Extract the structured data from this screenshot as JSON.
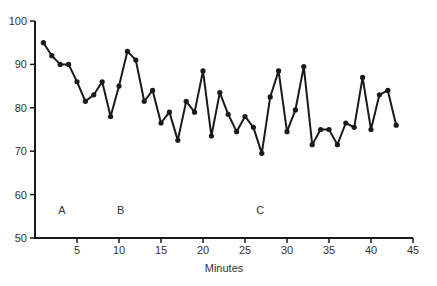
{
  "chart_data": {
    "type": "line",
    "title": "",
    "xlabel": "Minutes",
    "ylabel": "",
    "xlim": [
      0,
      45
    ],
    "ylim": [
      50,
      100
    ],
    "x_ticks": [
      5,
      10,
      15,
      20,
      25,
      30,
      35,
      40,
      45
    ],
    "y_ticks": [
      50,
      60,
      70,
      80,
      90,
      100
    ],
    "grid": false,
    "legend": null,
    "series": [
      {
        "name": "series",
        "x": [
          1,
          2,
          3,
          4,
          5,
          6,
          7,
          8,
          9,
          10,
          11,
          12,
          13,
          14,
          15,
          16,
          17,
          18,
          19,
          20,
          21,
          22,
          23,
          24,
          25,
          26,
          27,
          28,
          29,
          30,
          31,
          32,
          33,
          34,
          35,
          36,
          37,
          38,
          39,
          40,
          41,
          42,
          43
        ],
        "values": [
          95,
          92,
          90,
          90,
          86,
          81.5,
          83,
          86,
          78,
          85,
          93,
          91,
          81.5,
          84,
          76.5,
          79,
          72.5,
          81.5,
          79,
          88.5,
          73.5,
          83.5,
          78.5,
          74.5,
          78,
          75.5,
          69.5,
          82.5,
          88.5,
          74.5,
          79.5,
          89.5,
          71.5,
          75,
          75,
          71.5,
          76.5,
          75.5,
          87,
          75,
          83,
          84,
          76
        ]
      }
    ],
    "annotations": [
      {
        "text": "A",
        "x": 3.2,
        "y": 56.5
      },
      {
        "text": "B",
        "x": 10.2,
        "y": 56.5
      },
      {
        "text": "C",
        "x": 26.8,
        "y": 56.5
      }
    ]
  }
}
